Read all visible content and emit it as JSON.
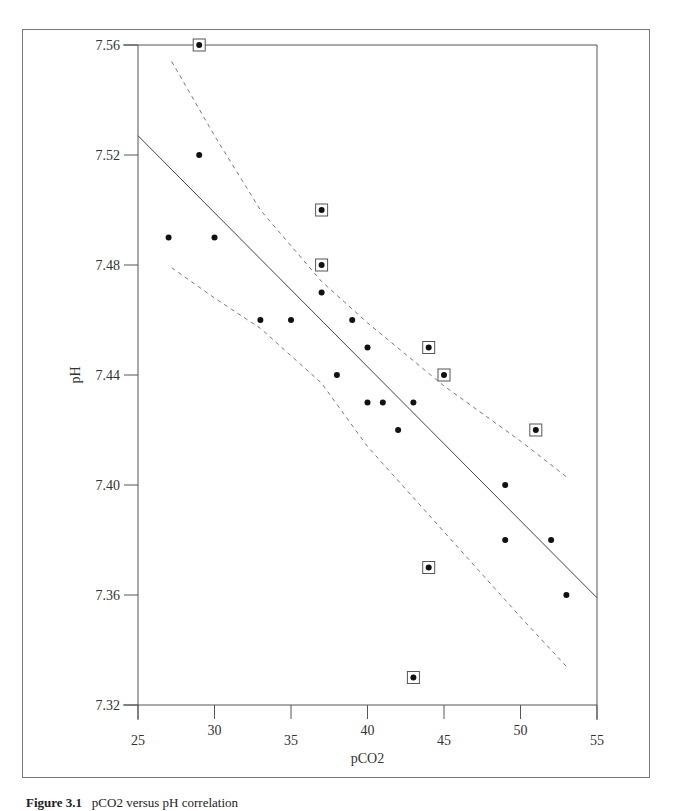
{
  "figure": {
    "caption_label": "Figure 3.1",
    "caption_text": "pCO2 versus pH correlation"
  },
  "chart_data": {
    "type": "scatter",
    "title": "",
    "xlabel": "pCO2",
    "ylabel": "pH",
    "xlim": [
      25,
      55
    ],
    "ylim": [
      7.32,
      7.56
    ],
    "x_ticks": [
      25,
      30,
      35,
      40,
      45,
      50,
      55
    ],
    "x_tick_labels": [
      "25",
      "30",
      "35",
      "40",
      "45",
      "50",
      "55"
    ],
    "y_ticks": [
      7.32,
      7.36,
      7.4,
      7.44,
      7.48,
      7.52,
      7.56
    ],
    "y_tick_labels": [
      "7.32",
      "7.36",
      "7.40",
      "7.44",
      "7.48",
      "7.52",
      "7.56"
    ],
    "grid": false,
    "legend": "none",
    "series": [
      {
        "name": "observations",
        "marker": "dot",
        "points": [
          [
            27,
            7.49
          ],
          [
            29,
            7.52
          ],
          [
            30,
            7.49
          ],
          [
            33,
            7.46
          ],
          [
            35,
            7.46
          ],
          [
            37,
            7.47
          ],
          [
            38,
            7.44
          ],
          [
            39,
            7.46
          ],
          [
            40,
            7.45
          ],
          [
            40,
            7.43
          ],
          [
            41,
            7.43
          ],
          [
            42,
            7.42
          ],
          [
            43,
            7.43
          ],
          [
            49,
            7.4
          ],
          [
            49,
            7.38
          ],
          [
            52,
            7.38
          ],
          [
            53,
            7.36
          ]
        ]
      },
      {
        "name": "outliers (boxed)",
        "marker": "dot-in-square",
        "points": [
          [
            29,
            7.56
          ],
          [
            37,
            7.5
          ],
          [
            37,
            7.48
          ],
          [
            44,
            7.45
          ],
          [
            45,
            7.44
          ],
          [
            51,
            7.42
          ],
          [
            44,
            7.37
          ],
          [
            43,
            7.33
          ]
        ]
      }
    ],
    "lines": [
      {
        "name": "regression",
        "style": "solid",
        "from": [
          25,
          7.527
        ],
        "to": [
          55,
          7.359
        ]
      },
      {
        "name": "upper confidence band",
        "style": "dashed",
        "points": [
          [
            27.2,
            7.554
          ],
          [
            30,
            7.527
          ],
          [
            33,
            7.5
          ],
          [
            37,
            7.474
          ],
          [
            40,
            7.459
          ],
          [
            45,
            7.436
          ],
          [
            50,
            7.416
          ],
          [
            53,
            7.403
          ]
        ]
      },
      {
        "name": "lower confidence band",
        "style": "dashed",
        "points": [
          [
            27.2,
            7.479
          ],
          [
            30,
            7.468
          ],
          [
            33,
            7.457
          ],
          [
            37,
            7.437
          ],
          [
            40,
            7.414
          ],
          [
            45,
            7.383
          ],
          [
            50,
            7.352
          ],
          [
            53,
            7.334
          ]
        ]
      }
    ],
    "colors": {
      "axis": "#555555",
      "points": "#111111",
      "lines": "#444444",
      "dashed": "#777777"
    }
  }
}
